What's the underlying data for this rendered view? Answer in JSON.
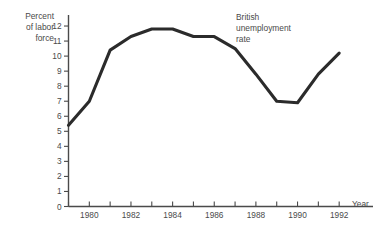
{
  "chart_data": {
    "type": "line",
    "title": "",
    "xlabel": "Year",
    "ylabel": "Percent of labor force",
    "ylabel_lines": [
      "Percent",
      "of labor",
      "force"
    ],
    "annotation": "British unemployment rate",
    "annotation_lines": [
      "British",
      "unemployment",
      "rate"
    ],
    "grid": false,
    "legend": "none",
    "line_color": "#2b2b2b",
    "axis_color": "#4a4a4a",
    "xlim": [
      1979,
      1993
    ],
    "ylim": [
      0,
      12.6
    ],
    "yticks": [
      0,
      1,
      2,
      3,
      4,
      5,
      6,
      7,
      8,
      9,
      10,
      11,
      12
    ],
    "ytick_labels": [
      "0",
      "1",
      "2",
      "3",
      "4",
      "5",
      "6",
      "7",
      "8",
      "9",
      "10",
      "11",
      "12"
    ],
    "xticks": [
      1979,
      1980,
      1981,
      1982,
      1983,
      1984,
      1985,
      1986,
      1987,
      1988,
      1989,
      1990,
      1991,
      1992
    ],
    "xtick_labels_shown": [
      "1980",
      "1982",
      "1984",
      "1986",
      "1988",
      "1990",
      "1992"
    ],
    "xtick_labels_shown_values": [
      1980,
      1982,
      1984,
      1986,
      1988,
      1990,
      1992
    ],
    "series": [
      {
        "name": "British unemployment rate",
        "x": [
          1979,
          1980,
          1981,
          1982,
          1983,
          1984,
          1985,
          1986,
          1987,
          1988,
          1989,
          1990,
          1991,
          1992
        ],
        "values": [
          5.4,
          7.0,
          10.4,
          11.3,
          11.8,
          11.8,
          11.3,
          11.3,
          10.5,
          8.8,
          7.0,
          6.9,
          8.8,
          10.2
        ]
      }
    ]
  },
  "axis_titles": {
    "x": "Year"
  }
}
